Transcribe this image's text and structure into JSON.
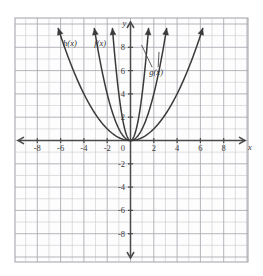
{
  "figure": {
    "kind": "coordinate-plane-graph",
    "background_color": "#ffffff",
    "plot_background_color": "#fdfdfd",
    "grid_minor_color": "#c9c9cf",
    "grid_major_color": "#a8a8b0",
    "axis_color": "#4a4a4a",
    "curve_color": "#3a3a3a"
  },
  "axes": {
    "x_axis_name": "x",
    "y_axis_name": "y",
    "origin_label": "0",
    "x_tick_labels": [
      "-8",
      "-6",
      "-4",
      "-2",
      "2",
      "4",
      "6",
      "8"
    ],
    "y_tick_labels_positive": [
      "2",
      "4",
      "6",
      "8"
    ],
    "y_tick_labels_negative": [
      "-2",
      "-4",
      "-6",
      "-8"
    ]
  },
  "curve_labels": [
    {
      "id": "h",
      "text": "h(x)"
    },
    {
      "id": "f",
      "text": "f(x)"
    },
    {
      "id": "g",
      "text": "g(x)"
    }
  ],
  "chart_data": {
    "type": "line",
    "title": "",
    "xlabel": "x",
    "ylabel": "y",
    "xlim": [
      -9.8,
      9.8
    ],
    "ylim": [
      -10.5,
      9.5
    ],
    "grid": true,
    "grid_step": 1,
    "major_grid_step": 2,
    "legend": "inline-labels",
    "x_ticks": [
      -8,
      -6,
      -4,
      -2,
      0,
      2,
      4,
      6,
      8
    ],
    "y_ticks": [
      -8,
      -6,
      -4,
      -2,
      0,
      2,
      4,
      6,
      8
    ],
    "series": [
      {
        "name": "h(x)",
        "form": "y = a*x^2",
        "a": 0.25,
        "vertex": [
          0,
          0
        ],
        "label_position": [
          -5.2,
          8.1
        ],
        "x_domain": [
          -6.2,
          6.2
        ],
        "points": [
          [
            -6,
            9
          ],
          [
            -5,
            6.25
          ],
          [
            -4,
            4
          ],
          [
            -3,
            2.25
          ],
          [
            -2,
            1
          ],
          [
            -1,
            0.25
          ],
          [
            0,
            0
          ],
          [
            1,
            0.25
          ],
          [
            2,
            1
          ],
          [
            3,
            2.25
          ],
          [
            4,
            4
          ],
          [
            5,
            6.25
          ],
          [
            6,
            9
          ]
        ]
      },
      {
        "name": "f(x)",
        "form": "y = a*x^2",
        "a": 1,
        "vertex": [
          0,
          0
        ],
        "label_position": [
          -2.6,
          8.1
        ],
        "x_domain": [
          -3.1,
          3.1
        ],
        "points": [
          [
            -3,
            9
          ],
          [
            -2.5,
            6.25
          ],
          [
            -2,
            4
          ],
          [
            -1.5,
            2.25
          ],
          [
            -1,
            1
          ],
          [
            -0.5,
            0.25
          ],
          [
            0,
            0
          ],
          [
            0.5,
            0.25
          ],
          [
            1,
            1
          ],
          [
            1.5,
            2.25
          ],
          [
            2,
            4
          ],
          [
            2.5,
            6.25
          ],
          [
            3,
            9
          ]
        ]
      },
      {
        "name": "g(x)",
        "form": "y = a*x^2",
        "a": 4,
        "vertex": [
          0,
          0
        ],
        "label_position": [
          2.2,
          5.6
        ],
        "x_domain": [
          -1.55,
          1.55
        ],
        "points": [
          [
            -1.5,
            9
          ],
          [
            -1.25,
            6.25
          ],
          [
            -1,
            4
          ],
          [
            -0.75,
            2.25
          ],
          [
            -0.5,
            1
          ],
          [
            -0.25,
            0.25
          ],
          [
            0,
            0
          ],
          [
            0.25,
            0.25
          ],
          [
            0.5,
            1
          ],
          [
            0.75,
            2.25
          ],
          [
            1,
            4
          ],
          [
            1.25,
            6.25
          ],
          [
            1.5,
            9
          ]
        ]
      }
    ]
  }
}
